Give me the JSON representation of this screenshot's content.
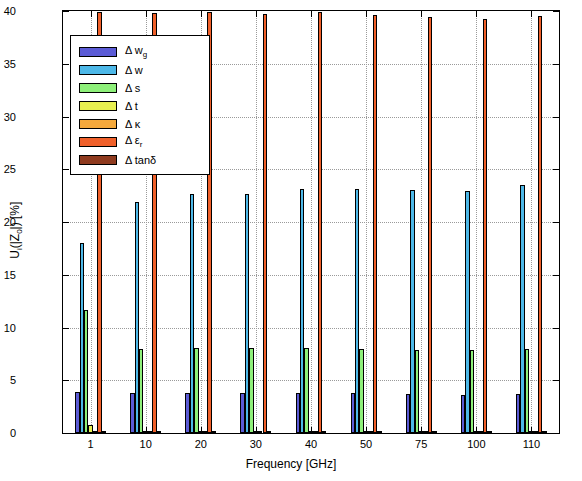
{
  "chart_data": {
    "type": "bar",
    "title": "",
    "xlabel": "Frequency [GHz]",
    "ylabel": "U_i(|Z_0|) [%]",
    "categories": [
      "1",
      "10",
      "20",
      "30",
      "40",
      "50",
      "75",
      "100",
      "110"
    ],
    "ylim": [
      0,
      40
    ],
    "yticks": [
      0,
      5,
      10,
      15,
      20,
      25,
      30,
      35,
      40
    ],
    "ytick_labels": [
      "0",
      "5",
      "10",
      "15",
      "20",
      "25",
      "30",
      "35",
      "40"
    ],
    "grid": true,
    "legend_position": "upper-left",
    "series": [
      {
        "name": "Δ w_g",
        "color": "#5b5bd6",
        "values": [
          3.9,
          3.8,
          3.8,
          3.8,
          3.8,
          3.8,
          3.7,
          3.6,
          3.7
        ]
      },
      {
        "name": "Δ w",
        "color": "#4db8e8",
        "values": [
          18.0,
          21.9,
          22.7,
          22.7,
          23.1,
          23.1,
          23.0,
          22.9,
          23.5
        ]
      },
      {
        "name": "Δ s",
        "color": "#8ef07a",
        "values": [
          11.7,
          8.0,
          8.1,
          8.1,
          8.1,
          8.0,
          7.9,
          7.9,
          8.0
        ]
      },
      {
        "name": "Δ t",
        "color": "#e8f050",
        "values": [
          0.8,
          0.1,
          0.1,
          0.1,
          0.1,
          0.1,
          0.1,
          0.1,
          0.1
        ]
      },
      {
        "name": "Δ κ",
        "color": "#f5a93c",
        "values": [
          0.05,
          0.05,
          0.05,
          0.05,
          0.05,
          0.05,
          0.05,
          0.05,
          0.05
        ]
      },
      {
        "name": "Δ ε_r",
        "color": "#f0602a",
        "values": [
          39.9,
          39.8,
          39.9,
          39.7,
          39.9,
          39.6,
          39.4,
          39.2,
          39.5
        ]
      },
      {
        "name": "Δ tanδ",
        "color": "#8f3b1f",
        "values": [
          0.05,
          0.05,
          0.05,
          0.05,
          0.05,
          0.05,
          0.05,
          0.05,
          0.05
        ]
      }
    ]
  },
  "legend": {
    "items": [
      {
        "label_main": "Δ w",
        "label_sub": "g"
      },
      {
        "label_main": "Δ w",
        "label_sub": ""
      },
      {
        "label_main": "Δ s",
        "label_sub": ""
      },
      {
        "label_main": "Δ t",
        "label_sub": ""
      },
      {
        "label_main": "Δ κ",
        "label_sub": ""
      },
      {
        "label_main": "Δ ε",
        "label_sub": "r"
      },
      {
        "label_main": "Δ tanδ",
        "label_sub": ""
      }
    ]
  },
  "axes": {
    "x_title": "Frequency [GHz]",
    "y_title_pre": "U",
    "y_title_sub": "i",
    "y_title_post": "(|Z",
    "y_title_sub2": "0",
    "y_title_end": "|) [%]"
  }
}
